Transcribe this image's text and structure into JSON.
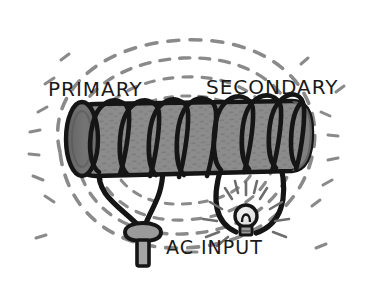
{
  "figure": {
    "background_color": "#ffffff"
  },
  "labels": {
    "primary": "PRIMARY",
    "secondary": "SECONDARY",
    "ac_input": "AC INPUT"
  },
  "colors": {
    "ink": "#1a1a1a",
    "core_fill": "#8c8c8c",
    "core_end_cap": "#6e6e6e",
    "field_line": "#8a8a8a",
    "plug_fill": "#9a9a9a",
    "bulb_base": "#9a9a9a",
    "bulb_glass": "#e8e8e8",
    "background": "#ffffff"
  },
  "components": {
    "core": {
      "name": "cylindrical core",
      "fill": "#8c8c8c",
      "texture": "hatched"
    },
    "primary_coil": {
      "name": "primary winding",
      "turns": 5,
      "side": "left"
    },
    "secondary_coil": {
      "name": "secondary winding",
      "turns": 5,
      "side": "right"
    },
    "plug": {
      "name": "AC power plug",
      "prongs": 1
    },
    "bulb": {
      "name": "light bulb",
      "state": "lit",
      "ray_count": 12
    },
    "field_lines": {
      "name": "magnetic field lines",
      "style": "dashed",
      "loop_count": 4
    }
  }
}
